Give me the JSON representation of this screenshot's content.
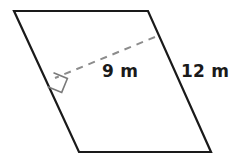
{
  "figure": {
    "name": "parallelogram-with-height",
    "type": "parallelogram",
    "background_color": "#ffffff",
    "stroke_color": "#1a1a1a",
    "dashed_color": "#8c8c8c",
    "units": "m",
    "labels": {
      "height": "9 m",
      "side": "12 m"
    },
    "measurements": {
      "height_value": 9,
      "height_units": "m",
      "side_value": 12,
      "side_units": "m"
    },
    "vertices": {
      "top_left": {
        "x": 14,
        "y": 11
      },
      "top_right": {
        "x": 148,
        "y": 11
      },
      "bottom_right": {
        "x": 211,
        "y": 152
      },
      "bottom_left": {
        "x": 79,
        "y": 152
      }
    },
    "altitude": {
      "from": {
        "x": 155,
        "y": 37
      },
      "to": {
        "x": 55,
        "y": 78
      },
      "style": "dashed"
    },
    "right_angle_marker": {
      "x": 55,
      "y": 78,
      "size": 14
    }
  }
}
